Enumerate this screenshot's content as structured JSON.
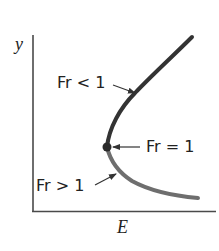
{
  "diagram": {
    "type": "specific-energy-curve",
    "axes": {
      "x_label": "E",
      "y_label": "y"
    },
    "regions": [
      {
        "label": "Fr < 1",
        "branch": "upper",
        "description": "subcritical branch"
      },
      {
        "label": "Fr = 1",
        "branch": "vertex",
        "description": "critical point"
      },
      {
        "label": "Fr > 1",
        "branch": "lower",
        "description": "supercritical branch"
      }
    ],
    "colors": {
      "axis": "#4a4a4a",
      "upper_branch": "#333333",
      "lower_branch": "#6e6e6e",
      "critical_point": "#2a2a2a",
      "text": "#222222"
    }
  }
}
